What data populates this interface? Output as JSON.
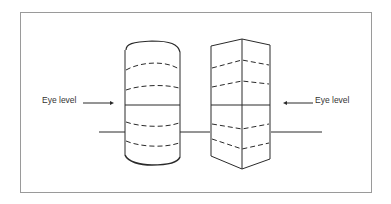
{
  "diagram": {
    "title": "",
    "labels": {
      "left_eye_level": "Eye level",
      "right_eye_level": "Eye level"
    },
    "objects": [
      {
        "name": "cylinder",
        "lines_above_eye_level": 2,
        "lines_below_eye_level": 2
      },
      {
        "name": "rectangular-prism",
        "lines_above_eye_level": 2,
        "lines_below_eye_level": 2
      }
    ],
    "colors": {
      "stroke": "#2a2a2a",
      "frame": "#9a9a9a",
      "background": "#ffffff"
    }
  }
}
